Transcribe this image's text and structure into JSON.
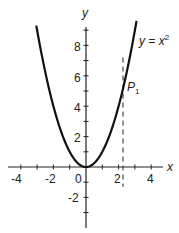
{
  "chart_data": {
    "type": "line",
    "title": "",
    "xlabel": "x",
    "ylabel": "y",
    "xlim": [
      -4.5,
      5
    ],
    "ylim": [
      -4,
      10
    ],
    "grid": false,
    "x_ticks": [
      -4,
      -3,
      -2,
      -1,
      0,
      1,
      2,
      3,
      4
    ],
    "x_tick_labels": [
      "-4",
      "-2",
      "0",
      "2",
      "4"
    ],
    "y_ticks": [
      -3,
      -2,
      -1,
      1,
      2,
      3,
      4,
      5,
      6,
      7,
      8,
      9
    ],
    "y_tick_labels": [
      "-2",
      "2",
      "4",
      "6",
      "8"
    ],
    "series": [
      {
        "name": "y = x²",
        "function": "x^2",
        "x_range": [
          -3.05,
          3.1
        ],
        "style": "solid"
      }
    ],
    "annotations": [
      {
        "type": "curve-label",
        "text_main": "y = x",
        "text_sup": "2"
      },
      {
        "type": "point-label",
        "text_main": "P",
        "text_sub": "1",
        "x": 2.27,
        "y": 5.15
      },
      {
        "type": "vertical-dashed-line",
        "x": 2.27,
        "y_range": [
          -1.3,
          7.2
        ]
      }
    ]
  },
  "labels": {
    "x_axis": "x",
    "y_axis": "y",
    "curve_main": "y = x",
    "curve_sup": "2",
    "point_main": "P",
    "point_sub": "1",
    "tick_x_m4": "-4",
    "tick_x_m2": "-2",
    "tick_x_0": "0",
    "tick_x_2": "2",
    "tick_x_4": "4",
    "tick_y_8": "8",
    "tick_y_6": "6",
    "tick_y_4": "4",
    "tick_y_2": "2",
    "tick_y_m2": "-2"
  }
}
